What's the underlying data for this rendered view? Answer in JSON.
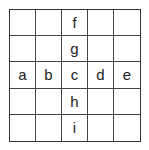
{
  "grid": {
    "rows": 5,
    "cols": 5,
    "cells": [
      [
        "",
        "",
        "f",
        "",
        ""
      ],
      [
        "",
        "",
        "g",
        "",
        ""
      ],
      [
        "a",
        "b",
        "c",
        "d",
        "e"
      ],
      [
        "",
        "",
        "h",
        "",
        ""
      ],
      [
        "",
        "",
        "i",
        "",
        ""
      ]
    ]
  }
}
